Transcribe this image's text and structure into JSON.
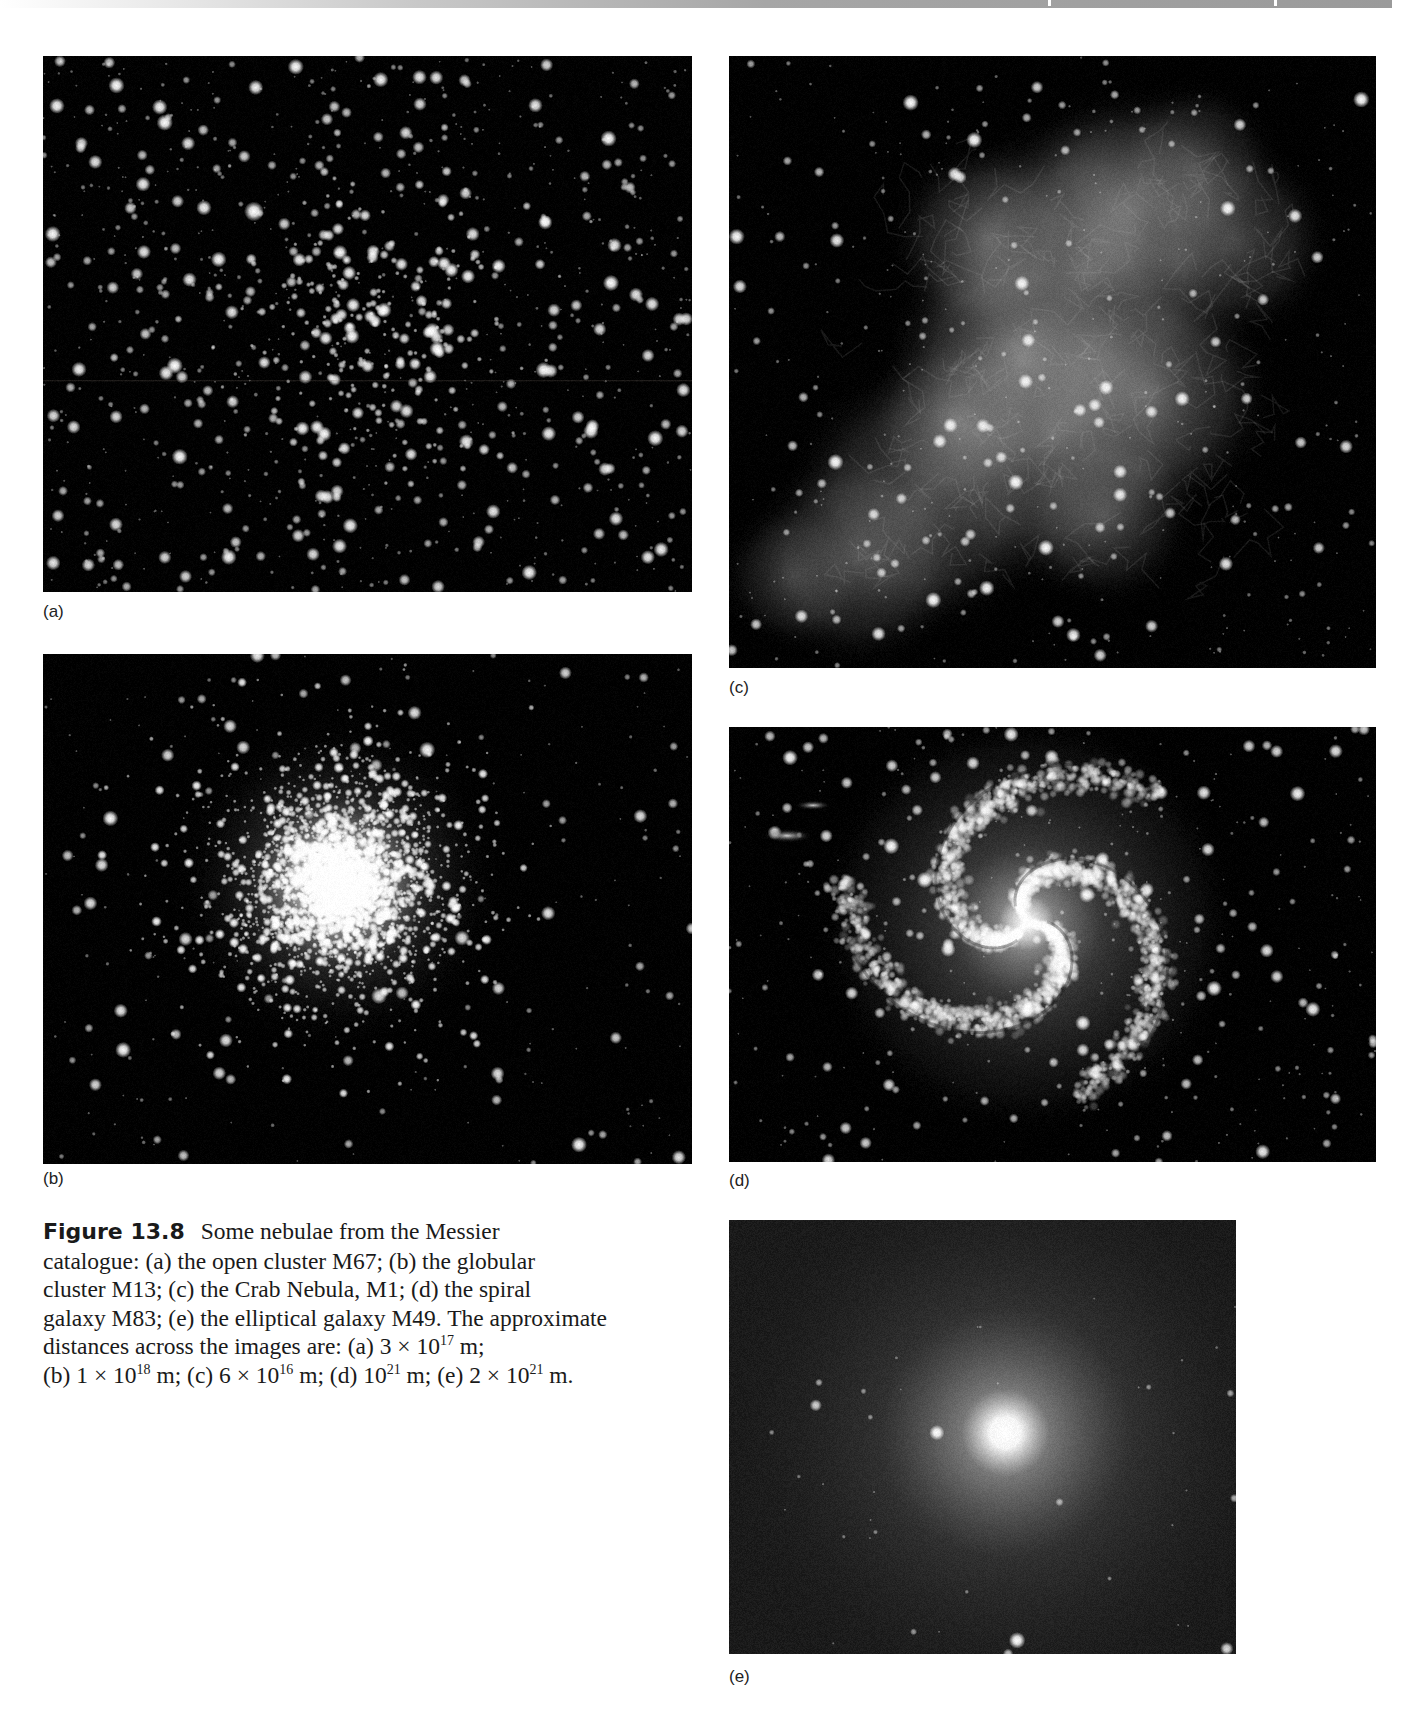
{
  "page": {
    "background": "#ffffff",
    "header_bar": {
      "gradient_colors": [
        "#ffffff",
        "#a6a6a6",
        "#9a9a9a"
      ]
    }
  },
  "figure": {
    "number": "Figure 13.8",
    "caption_lines": [
      "Some nebulae from the Messier",
      "catalogue: (a) the open cluster M67; (b) the globular",
      "cluster M13; (c) the Crab Nebula, M1; (d) the spiral",
      "galaxy M83; (e) the elliptical galaxy M49. The approximate",
      "distances across the images are: (a) 3 × 10",
      "17",
      " m;",
      "(b) 1 × 10",
      "18",
      " m; (c) 6 × 10",
      "16",
      " m; (d) 10",
      "21",
      " m; (e) 2 × 10",
      "21",
      " m."
    ],
    "caption_parts": {
      "line1": "Some nebulae from the Messier",
      "line2": "catalogue: (a) the open cluster M67; (b) the globular",
      "line3": "cluster M13; (c) the Crab Nebula, M1; (d) the spiral",
      "line4": "galaxy M83; (e) the elliptical galaxy M49. The approximate",
      "line5_a": "distances across the images are: (a) 3 × 10",
      "line5_a_exp": "17",
      "line5_a_unit": " m;",
      "line6_b": "(b) 1 × 10",
      "line6_b_exp": "18",
      "line6_c": " m; (c) 6 × 10",
      "line6_c_exp": "16",
      "line6_d": " m; (d) 10",
      "line6_d_exp": "21",
      "line6_e": " m; (e) 2 × 10",
      "line6_e_exp": "21",
      "line6_end": " m."
    },
    "panels": [
      {
        "id": "a",
        "label": "(a)",
        "object": "open cluster M67",
        "distance_across": "3 × 10^17 m",
        "type": "open-cluster",
        "box": [
          43,
          56,
          649,
          536
        ],
        "label_pos": [
          43,
          603
        ],
        "seed": 11,
        "field_stars": 900,
        "cluster_stars": 260,
        "cluster_center": [
          0.52,
          0.5
        ],
        "cluster_radius": 0.2
      },
      {
        "id": "b",
        "label": "(b)",
        "object": "globular cluster M13",
        "distance_across": "1 × 10^18 m",
        "type": "globular-cluster",
        "box": [
          43,
          654,
          649,
          510
        ],
        "label_pos": [
          43,
          1170
        ],
        "seed": 23,
        "field_stars": 260,
        "cluster_stars": 4200,
        "cluster_center": [
          0.455,
          0.45
        ],
        "cluster_radius": 0.19
      },
      {
        "id": "c",
        "label": "(c)",
        "object": "Crab Nebula, M1",
        "distance_across": "6 × 10^16 m",
        "type": "nebula",
        "box": [
          729,
          56,
          647,
          612
        ],
        "label_pos": [
          729,
          679
        ],
        "seed": 37,
        "field_stars": 420
      },
      {
        "id": "d",
        "label": "(d)",
        "object": "spiral galaxy M83",
        "distance_across": "10^21 m",
        "type": "spiral-galaxy",
        "box": [
          729,
          727,
          647,
          435
        ],
        "label_pos": [
          729,
          1172
        ],
        "seed": 51,
        "field_stars": 380,
        "galaxy_center": [
          0.46,
          0.45
        ]
      },
      {
        "id": "e",
        "label": "(e)",
        "object": "elliptical galaxy M49",
        "distance_across": "2 × 10^21 m",
        "type": "elliptical-galaxy",
        "box": [
          729,
          1220,
          507,
          434
        ],
        "label_pos": [
          729,
          1668
        ],
        "seed": 67,
        "field_stars": 40,
        "galaxy_center": [
          0.545,
          0.49
        ],
        "companion_star": [
          0.41,
          0.49
        ]
      }
    ]
  }
}
